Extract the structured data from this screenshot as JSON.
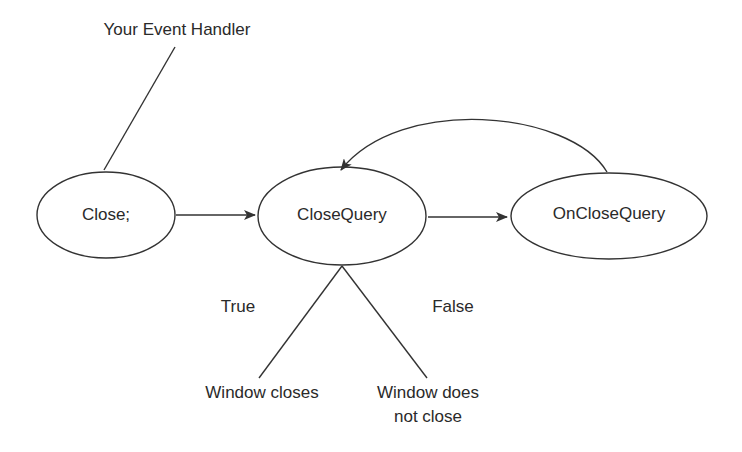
{
  "diagram": {
    "type": "flow",
    "stroke_color": "#333333",
    "text_color": "#2a2a2a",
    "background": "#ffffff",
    "nodes": [
      {
        "id": "handler",
        "label": "Your Event Handler",
        "shape": "text"
      },
      {
        "id": "close",
        "label": "Close;",
        "shape": "ellipse"
      },
      {
        "id": "closequery",
        "label": "CloseQuery",
        "shape": "ellipse"
      },
      {
        "id": "onclosequery",
        "label": "OnCloseQuery",
        "shape": "ellipse"
      },
      {
        "id": "closes",
        "label": "Window closes",
        "shape": "text"
      },
      {
        "id": "notclose",
        "label_line1": "Window does",
        "label_line2": "not close",
        "shape": "text"
      }
    ],
    "edges": [
      {
        "from": "handler",
        "to": "close",
        "style": "line"
      },
      {
        "from": "close",
        "to": "closequery",
        "style": "arrow"
      },
      {
        "from": "closequery",
        "to": "onclosequery",
        "style": "arrow"
      },
      {
        "from": "onclosequery",
        "to": "closequery",
        "style": "curved-arrow"
      },
      {
        "from": "closequery",
        "to": "closes",
        "style": "line",
        "label": "True"
      },
      {
        "from": "closequery",
        "to": "notclose",
        "style": "line",
        "label": "False"
      }
    ],
    "branch_labels": {
      "true": "True",
      "false": "False"
    }
  }
}
